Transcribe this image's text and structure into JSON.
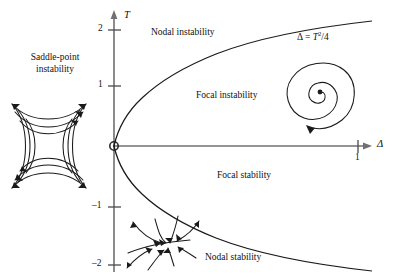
{
  "figure": {
    "background": "#ffffff",
    "ink": "#111111",
    "axis_color": "#666666"
  },
  "axes": {
    "x": {
      "name": "Δ",
      "ticks": [
        {
          "label": "1",
          "value": 1
        }
      ]
    },
    "y": {
      "name": "T",
      "ticks": [
        {
          "label": "2",
          "value": 2
        },
        {
          "label": "1",
          "value": 1
        },
        {
          "label": "–1",
          "value": -1
        },
        {
          "label": "–2",
          "value": -2
        }
      ]
    },
    "origin_marker": "origin-circle"
  },
  "curve": {
    "label": "Δ = T²/4",
    "equation_text": "Δ = T ⁄ 4"
  },
  "regions": [
    {
      "name": "saddle-point-instability",
      "label_line1": "Saddle-point",
      "label_line2": "instability"
    },
    {
      "name": "nodal-instability",
      "label": "Nodal instability"
    },
    {
      "name": "focal-instability",
      "label": "Focal instability"
    },
    {
      "name": "focal-stability",
      "label": "Focal stability"
    },
    {
      "name": "nodal-stability",
      "label": "Nodal stability"
    }
  ],
  "phase_portraits": [
    {
      "name": "saddle-portrait",
      "kind": "saddle"
    },
    {
      "name": "spiral-portrait",
      "kind": "unstable-spiral"
    },
    {
      "name": "node-portrait",
      "kind": "stable-node"
    }
  ]
}
